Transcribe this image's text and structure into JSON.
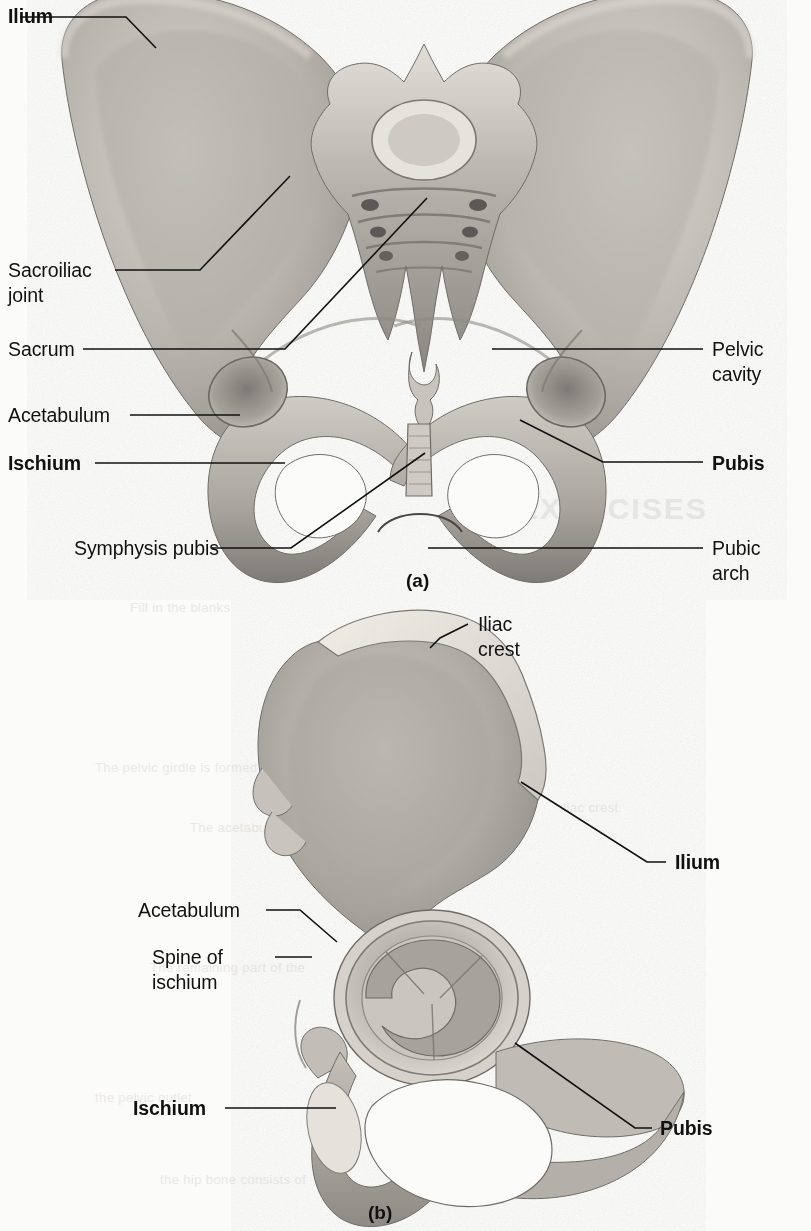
{
  "figure": {
    "background_color": "#fbfbf9",
    "ink_color": "#111111"
  },
  "panel_a": {
    "caption": "(a)",
    "view": "anterior view of the bony pelvis",
    "labels": [
      {
        "id": "ilium",
        "text": "Ilium",
        "bold": true,
        "align": "left",
        "x": 8,
        "y": 4,
        "line": "20,17 126,17 156,48"
      },
      {
        "id": "sacroiliac-joint",
        "text": "Sacroiliac\njoint",
        "bold": false,
        "align": "left",
        "x": 8,
        "y": 258,
        "line": "115,270 200,270 290,176"
      },
      {
        "id": "sacrum",
        "text": "Sacrum",
        "bold": false,
        "align": "left",
        "x": 8,
        "y": 337,
        "line": "83,349 285,349 427,198"
      },
      {
        "id": "acetabulum",
        "text": "Acetabulum",
        "bold": false,
        "align": "left",
        "x": 8,
        "y": 403,
        "line": "130,415 240,415"
      },
      {
        "id": "ischium",
        "text": "Ischium",
        "bold": true,
        "align": "left",
        "x": 8,
        "y": 451,
        "line": "95,463 285,463"
      },
      {
        "id": "symphysis-pubis",
        "text": "Symphysis pubis",
        "bold": false,
        "align": "left",
        "x": 74,
        "y": 536,
        "line": "212,548 291,548 425,453"
      },
      {
        "id": "pelvic-cavity",
        "text": "Pelvic\ncavity",
        "bold": false,
        "align": "left",
        "x": 712,
        "y": 337,
        "line": "492,349 703,349"
      },
      {
        "id": "pubis",
        "text": "Pubis",
        "bold": true,
        "align": "left",
        "x": 712,
        "y": 451,
        "line": "520,420 603,462 703,462"
      },
      {
        "id": "pubic-arch",
        "text": "Pubic\narch",
        "bold": false,
        "align": "left",
        "x": 712,
        "y": 536,
        "line": "428,548 703,548"
      }
    ]
  },
  "panel_b": {
    "caption": "(b)",
    "view": "lateral view of the right hip bone",
    "labels": [
      {
        "id": "iliac-crest",
        "text": "Iliac\ncrest",
        "bold": false,
        "align": "left",
        "x": 478,
        "y": 612,
        "line": "468,624 440,638 430,648"
      },
      {
        "id": "ilium",
        "text": "Ilium",
        "bold": true,
        "align": "left",
        "x": 675,
        "y": 850,
        "line": "521,782 647,862 666,862"
      },
      {
        "id": "acetabulum",
        "text": "Acetabulum",
        "bold": false,
        "align": "left",
        "x": 138,
        "y": 898,
        "line": "266,910 300,910 337,942"
      },
      {
        "id": "spine-of-ischium",
        "text": "Spine of\nischium",
        "bold": false,
        "align": "left",
        "x": 152,
        "y": 945,
        "line": "275,957 312,957"
      },
      {
        "id": "ischium",
        "text": "Ischium",
        "bold": true,
        "align": "left",
        "x": 133,
        "y": 1096,
        "line": "225,1108 336,1108"
      },
      {
        "id": "pubis",
        "text": "Pubis",
        "bold": true,
        "align": "left",
        "x": 660,
        "y": 1116,
        "line": "515,1043 635,1128 652,1128"
      }
    ]
  },
  "bleed_through": [
    {
      "text": "EXERCISES",
      "x": 518,
      "y": 492,
      "size": 30
    },
    {
      "text": "Fill in the blanks",
      "x": 130,
      "y": 600,
      "size": 13
    },
    {
      "text": "The pelvic girdle is formed by",
      "x": 95,
      "y": 760,
      "size": 13
    },
    {
      "text": "The acetabulum receives the head",
      "x": 190,
      "y": 820,
      "size": 13
    },
    {
      "text": "iliac crest",
      "x": 560,
      "y": 800,
      "size": 13
    },
    {
      "text": "The remaining part of the",
      "x": 150,
      "y": 960,
      "size": 13
    },
    {
      "text": "the pelvic outlet",
      "x": 95,
      "y": 1090,
      "size": 13
    },
    {
      "text": "the hip bone consists of",
      "x": 160,
      "y": 1172,
      "size": 13
    }
  ]
}
